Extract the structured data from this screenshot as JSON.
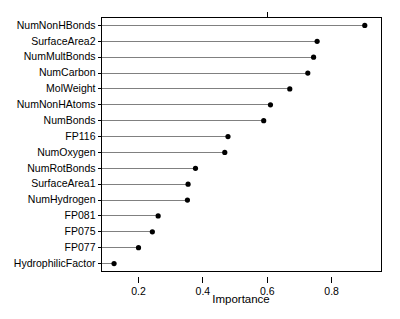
{
  "chart_data": {
    "type": "scatter",
    "subtype": "dotplot-lollipop",
    "title": "",
    "xlabel": "Importance",
    "ylabel": "",
    "categories": [
      "NumNonHBonds",
      "SurfaceArea2",
      "NumMultBonds",
      "NumCarbon",
      "MolWeight",
      "NumNonHAtoms",
      "NumBonds",
      "FP116",
      "NumOxygen",
      "NumRotBonds",
      "SurfaceArea1",
      "NumHydrogen",
      "FP081",
      "FP075",
      "FP077",
      "HydrophilicFactor"
    ],
    "values": [
      0.903,
      0.755,
      0.744,
      0.726,
      0.67,
      0.61,
      0.589,
      0.478,
      0.468,
      0.377,
      0.354,
      0.352,
      0.261,
      0.243,
      0.2,
      0.124
    ],
    "xlim": [
      0.085,
      0.955
    ],
    "xticks": [
      0.2,
      0.4,
      0.6,
      0.8
    ],
    "xtick_labels": [
      "0.2",
      "0.4",
      "0.6",
      "0.8"
    ],
    "grid": false,
    "legend": null,
    "marker": "filled-circle",
    "marker_color": "#000000",
    "line_color": "#808080",
    "panel_border_color": "#000000",
    "background": "#ffffff"
  },
  "axis": {
    "x_title": "Importance"
  }
}
